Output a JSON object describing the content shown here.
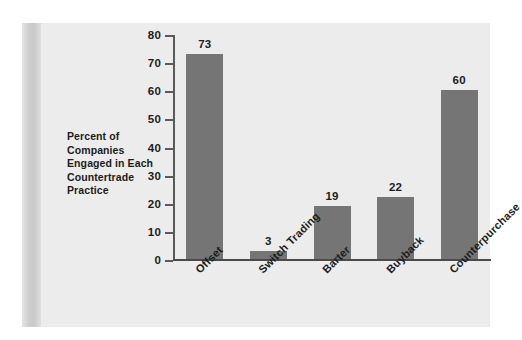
{
  "chart_data": {
    "type": "bar",
    "title": "",
    "subtitle": "",
    "xlabel": "",
    "ylabel": "Percent of Companies Engaged in Each Countertrade Practice",
    "categories": [
      "Offset",
      "Switch Trading",
      "Barter",
      "Buyback",
      "Counterpurchase"
    ],
    "values": [
      73,
      3,
      19,
      22,
      60
    ],
    "value_labels": [
      "73",
      "3",
      "19",
      "22",
      "60"
    ],
    "ylim": [
      0,
      80
    ],
    "yticks": [
      0,
      10,
      20,
      30,
      40,
      50,
      60,
      70,
      80
    ],
    "ytick_labels": [
      "0",
      "10",
      "20",
      "30",
      "40",
      "50",
      "60",
      "70",
      "80"
    ],
    "grid": false,
    "legend": false,
    "legend_position": "none",
    "bar_color": "#757575",
    "panel_background": "#ececec",
    "axis_color": "#4a4a4a",
    "text_color": "#1c1c1c",
    "category_label_rotation": -45
  },
  "axis_title": {
    "lines": [
      "Percent of",
      "Companies",
      "Engaged in Each",
      "Countertrade",
      "Practice"
    ],
    "text": "Percent of Companies Engaged in Each Countertrade Practice"
  }
}
